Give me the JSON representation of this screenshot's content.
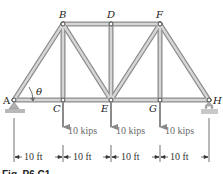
{
  "figure": {
    "caption": "Fig. P6.C1",
    "colors": {
      "member_fill": "#c9c9c9",
      "member_edge": "#8c8c8c",
      "load_arrow": "#8a8a8a",
      "load_text": "#6a6a6a",
      "support": "#b0b0b0"
    },
    "joints": {
      "A": "A",
      "B": "B",
      "C": "C",
      "D": "D",
      "E": "E",
      "F": "F",
      "G": "G",
      "H": "H"
    },
    "angle_label": "θ",
    "loads": [
      {
        "joint": "C",
        "label": "10 kips"
      },
      {
        "joint": "E",
        "label": "10 kips"
      },
      {
        "joint": "G",
        "label": "10 kips"
      }
    ],
    "dimensions": [
      {
        "label": "10 ft"
      },
      {
        "label": "10 ft"
      },
      {
        "label": "10 ft"
      },
      {
        "label": "10 ft"
      }
    ]
  }
}
